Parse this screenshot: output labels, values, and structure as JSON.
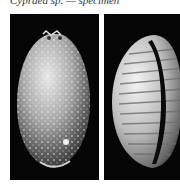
{
  "figure": {
    "caption_partial": "Cypraea sp. — specimen",
    "panels": [
      {
        "label": "dorsal view",
        "background": "#050505"
      },
      {
        "label": "ventral view",
        "background": "#050505"
      }
    ]
  }
}
